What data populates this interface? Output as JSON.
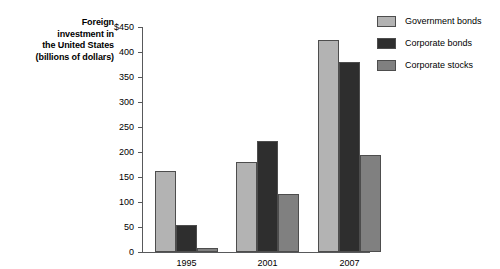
{
  "chart_data": {
    "type": "bar",
    "title": "",
    "subtitle": "",
    "xlabel": "",
    "ylabel": "Foreign investment in the United States (billions of dollars)",
    "ylabel_lines": [
      "Foreign",
      "investment in",
      "the United States",
      "(billions of dollars)"
    ],
    "categories": [
      "1995",
      "2001",
      "2007"
    ],
    "series": [
      {
        "name": "Government bonds",
        "color": "#b3b3b3",
        "values": [
          163,
          180,
          424
        ]
      },
      {
        "name": "Corporate bonds",
        "color": "#2e2e2e",
        "values": [
          55,
          222,
          380
        ]
      },
      {
        "name": "Corporate stocks",
        "color": "#808080",
        "values": [
          8,
          117,
          194
        ]
      }
    ],
    "ylim": [
      0,
      450
    ],
    "ytick_values": [
      0,
      50,
      100,
      150,
      200,
      250,
      300,
      350,
      400,
      450
    ],
    "ytick_labels": [
      "0",
      "50",
      "100",
      "150",
      "200",
      "250",
      "300",
      "350",
      "400",
      "$450"
    ],
    "grid": false,
    "legend_position": "top-right",
    "axis_color": "#58595b",
    "bar_border_color": "#4d4d4d",
    "background": "#ffffff"
  },
  "legend": {
    "items": [
      {
        "label": "Government bonds",
        "color": "#b3b3b3"
      },
      {
        "label": "Corporate bonds",
        "color": "#2e2e2e"
      },
      {
        "label": "Corporate stocks",
        "color": "#808080"
      }
    ]
  }
}
